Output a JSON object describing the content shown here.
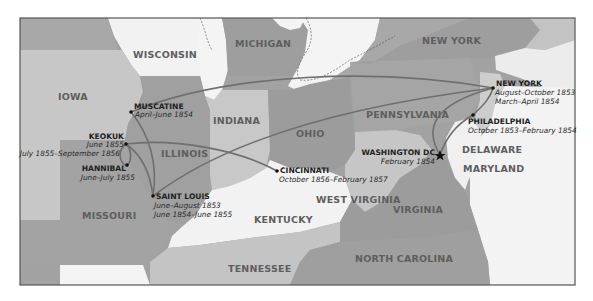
{
  "map": {
    "colors": {
      "background": "#ffffff",
      "frame": "#555555",
      "white_state": "#f4f4f4",
      "light_state": "#c9c9c9",
      "mid_state": "#a9a9a9",
      "dark_state": "#9a9a9a",
      "route": "#6f6f6f",
      "marker": "#111111"
    },
    "states": [
      {
        "id": "wisconsin",
        "label": "WISCONSIN"
      },
      {
        "id": "michigan",
        "label": "MICHIGAN"
      },
      {
        "id": "new-york",
        "label": "NEW YORK"
      },
      {
        "id": "iowa",
        "label": "IOWA"
      },
      {
        "id": "indiana",
        "label": "INDIANA"
      },
      {
        "id": "ohio",
        "label": "OHIO"
      },
      {
        "id": "pennsylvania",
        "label": "PENNSYLVANIA"
      },
      {
        "id": "illinois",
        "label": "ILLINOIS"
      },
      {
        "id": "missouri",
        "label": "MISSOURI"
      },
      {
        "id": "kentucky",
        "label": "KENTUCKY"
      },
      {
        "id": "west-virginia",
        "label": "WEST VIRGINIA"
      },
      {
        "id": "virginia",
        "label": "VIRGINIA"
      },
      {
        "id": "delaware",
        "label": "DELAWARE"
      },
      {
        "id": "maryland",
        "label": "MARYLAND"
      },
      {
        "id": "tennessee",
        "label": "TENNESSEE"
      },
      {
        "id": "north-carolina",
        "label": "NORTH CAROLINA"
      }
    ],
    "cities": [
      {
        "id": "muscatine",
        "name": "MUSCATINE",
        "dates": [
          "April–June 1854"
        ],
        "marker": "dot"
      },
      {
        "id": "keokuk",
        "name": "KEOKUK",
        "dates": [
          "June 1855",
          "July 1855–September 1856"
        ],
        "marker": "dot"
      },
      {
        "id": "hannibal",
        "name": "HANNIBAL",
        "dates": [
          "June–July 1855"
        ],
        "marker": "dot"
      },
      {
        "id": "saint-louis",
        "name": "SAINT LOUIS",
        "dates": [
          "June–August 1853",
          "June 1854–June 1855"
        ],
        "marker": "dot"
      },
      {
        "id": "cincinnati",
        "name": "CINCINNATI",
        "dates": [
          "October 1856–February 1857"
        ],
        "marker": "dot"
      },
      {
        "id": "washington-dc",
        "name": "WASHINGTON DC",
        "dates": [
          "February 1854"
        ],
        "marker": "star"
      },
      {
        "id": "new-york-city",
        "name": "NEW YORK",
        "dates": [
          "August–October 1853",
          "March–April 1854"
        ],
        "marker": "dot"
      },
      {
        "id": "philadelphia",
        "name": "PHILADELPHIA",
        "dates": [
          "October 1853–February 1854"
        ],
        "marker": "dot"
      }
    ],
    "routes": [
      {
        "from": "saint-louis",
        "to": "new-york-city"
      },
      {
        "from": "new-york-city",
        "to": "philadelphia"
      },
      {
        "from": "philadelphia",
        "to": "washington-dc"
      },
      {
        "from": "washington-dc",
        "to": "new-york-city"
      },
      {
        "from": "new-york-city",
        "to": "muscatine"
      },
      {
        "from": "muscatine",
        "to": "saint-louis"
      },
      {
        "from": "saint-louis",
        "to": "keokuk"
      },
      {
        "from": "keokuk",
        "to": "hannibal"
      },
      {
        "from": "hannibal",
        "to": "keokuk"
      },
      {
        "from": "keokuk",
        "to": "cincinnati"
      }
    ]
  }
}
